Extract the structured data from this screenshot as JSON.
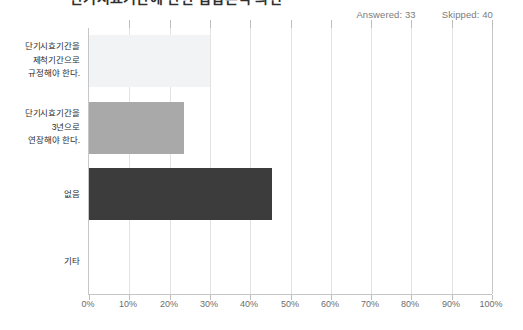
{
  "title": "단기시효기간에 관한 입법론적 의견",
  "summary": {
    "answered_label": "Answered: 33",
    "skipped_label": "Skipped: 40"
  },
  "colors": {
    "bar_light": "#f1f3f4",
    "bar_medium": "#a9a9a9",
    "bar_dark": "#3c3c3c",
    "gridline": "#e3e3e3",
    "axis": "#c6c6c6",
    "label_text": "#2d2d2d",
    "tick_text": "#6d6d6d",
    "summary_text": "#7b7b7b"
  },
  "chart_data": {
    "type": "bar",
    "orientation": "horizontal",
    "title": "단기시효기간에 관한 입법론적 의견",
    "xlabel": "",
    "ylabel": "",
    "xlim": [
      0,
      100
    ],
    "grid": true,
    "legend": false,
    "categories": [
      "단기시효기간을 제척기간으로 규정해야 한다.",
      "단기시효기간을 3년으로 연장해야 한다.",
      "없음",
      "기타"
    ],
    "values": [
      30.0,
      23.5,
      45.5,
      0.0
    ],
    "bar_colors": [
      "#f1f3f4",
      "#a9a9a9",
      "#3c3c3c",
      "#f1f3f4"
    ],
    "xticks": [
      0,
      10,
      20,
      30,
      40,
      50,
      60,
      70,
      80,
      90,
      100
    ],
    "xtick_labels": [
      "0%",
      "10%",
      "20%",
      "30%",
      "40%",
      "50%",
      "60%",
      "70%",
      "80%",
      "90%",
      "100%"
    ]
  },
  "category_lines": {
    "c0": [
      "단기시효기간을",
      "제척기간으로",
      "규정해야 한다."
    ],
    "c1": [
      "단기시효기간을",
      "3년으로",
      "연장해야 한다."
    ],
    "c2": [
      "없음"
    ],
    "c3": [
      "기타"
    ]
  }
}
